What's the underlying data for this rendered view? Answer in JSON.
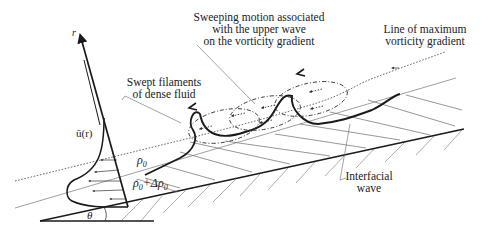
{
  "figure": {
    "type": "schematic",
    "labels": {
      "sweeping_line1": "Sweeping motion associated",
      "sweeping_line2": "with the upper wave",
      "sweeping_line3": "on the vorticity gradient",
      "max_vort_line1": "Line of maximum",
      "max_vort_line2": "vorticity gradient",
      "swept_line1": "Swept filaments",
      "swept_line2": "of dense fluid",
      "interfacial_line1": "Interfacial",
      "interfacial_line2": "wave",
      "r_axis": "r",
      "velocity_profile": "ū(r)",
      "rho0": "ρ0",
      "rho0_sym": "ρ",
      "rho0_sub": "0",
      "rho_dense_a": "ρ",
      "rho_dense_sub_a": "0",
      "rho_dense_plus": "+Δρ",
      "rho_dense_sub_b": "0",
      "theta": "θ"
    },
    "colors": {
      "ink": "#1a1a1a",
      "thin": "#555555",
      "hatch": "#6a6a6a"
    }
  }
}
